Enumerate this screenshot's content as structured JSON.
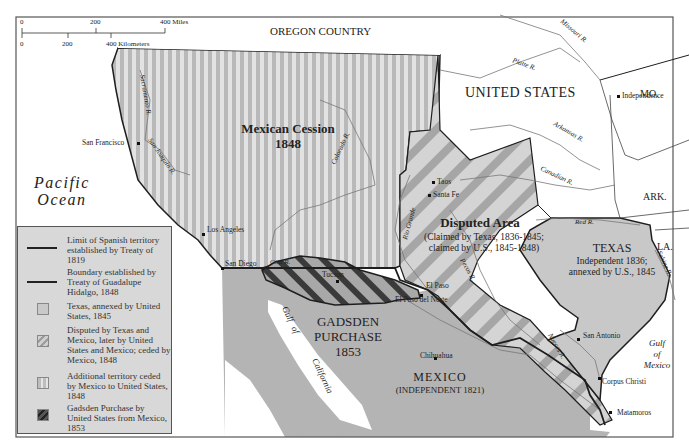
{
  "scale_bar": {
    "miles_ticks": [
      "0",
      "200",
      "400 Miles"
    ],
    "km_ticks": [
      "0",
      "200",
      "400 Kilometers"
    ]
  },
  "regions": {
    "oregon_country": "OREGON COUNTRY",
    "united_states": "UNITED STATES",
    "mexican_cession": {
      "name": "Mexican Cession",
      "year": "1848"
    },
    "disputed_area": {
      "name": "Disputed Area",
      "line1": "(Claimed by Texas, 1836-1845;",
      "line2": "claimed by U.S., 1845-1848)"
    },
    "texas": {
      "name": "TEXAS",
      "line1": "Independent 1836;",
      "line2": "annexed by U.S., 1845"
    },
    "gadsden": {
      "line1": "GADSDEN",
      "line2": "PURCHASE",
      "year": "1853"
    },
    "mexico": {
      "name": "MEXICO",
      "sub": "(INDEPENDENT 1821)"
    },
    "states": [
      "MO.",
      "ARK.",
      "LA."
    ]
  },
  "water": {
    "pacific": [
      "Pacific",
      "Ocean"
    ],
    "gulf_mexico": [
      "Gulf",
      "of",
      "Mexico"
    ],
    "gulf_california": [
      "Gulf",
      "of",
      "California"
    ]
  },
  "rivers": [
    "Missouri R.",
    "Platte R.",
    "Arkansas R.",
    "Canadian R.",
    "Red R.",
    "Sabine R.",
    "Colorado R.",
    "Rio Grande",
    "Pecos R.",
    "Nueces R.",
    "Gila R.",
    "Sacramento R.",
    "San Joaquin R."
  ],
  "cities": [
    "Independence",
    "San Francisco",
    "Los Angeles",
    "San Diego",
    "Taos",
    "Santa Fe",
    "Tucson",
    "El Paso",
    "El Paso del Norte",
    "Chihuahua",
    "San Antonio",
    "Corpus Christi",
    "Matamoros"
  ],
  "legend": {
    "items": [
      {
        "text": "Limit of Spanish territory established by Treaty of 1819",
        "symbol": "line"
      },
      {
        "text": "Boundary established by Treaty of Guadalupe Hidalgo, 1848",
        "symbol": "line"
      },
      {
        "text": "Texas, annexed by United States, 1845",
        "symbol": "swatch-texas"
      },
      {
        "text": "Disputed by Texas and Mexico, later by United States and Mexico; ceded by Mexico, 1848",
        "symbol": "swatch-disputed"
      },
      {
        "text": "Additional territory ceded by Mexico to United States, 1848",
        "symbol": "swatch-cession"
      },
      {
        "text": "Gadsden Purchase by United States from Mexico, 1853",
        "symbol": "swatch-gadsden"
      }
    ]
  },
  "colors": {
    "land_us": "#ffffff",
    "cession_light": "#e2e2e2",
    "cession_dark": "#b9b9b9",
    "disputed_light": "#d2d2d2",
    "disputed_dark": "#a4a4a4",
    "texas": "#c8c8c8",
    "mexico": "#b4b4b4",
    "gadsden_dark": "#333333",
    "boundary": "#1e1e1e",
    "river": "#777777"
  }
}
